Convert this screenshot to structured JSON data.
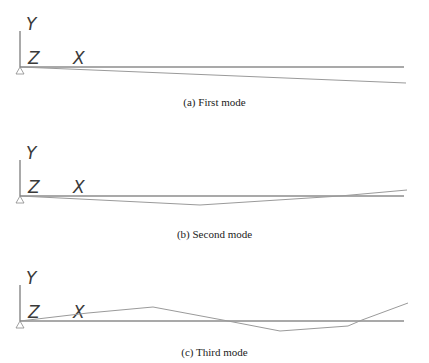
{
  "colors": {
    "axis": "#555555",
    "baseline": "#555555",
    "mode": "#9a9a9a",
    "text": "#3a3a3a"
  },
  "axis_labels": {
    "y": "Y",
    "z": "Z",
    "x": "X"
  },
  "panels": [
    {
      "caption": "(a) First mode",
      "baseline_y": 67,
      "mode_points": "20,67 406,83"
    },
    {
      "caption": "(b) Second mode",
      "baseline_y": 196,
      "mode_points": "20,196 200,205 340,196 407,190"
    },
    {
      "caption": "(c) Third mode",
      "baseline_y": 321,
      "mode_points": "20,321 88,313 153,307 228,321 280,331 348,326 362,320 408,303"
    }
  ]
}
